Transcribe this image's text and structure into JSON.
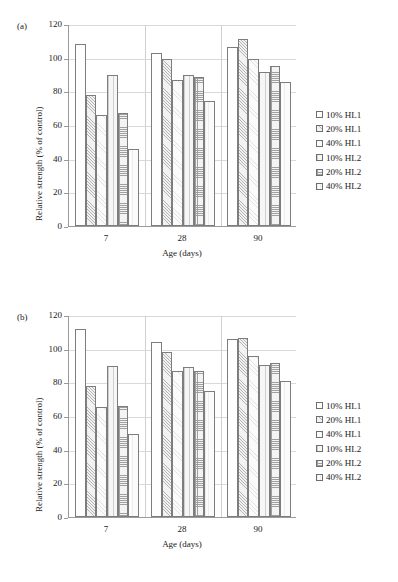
{
  "figure": {
    "panels": [
      {
        "label": "(a)"
      },
      {
        "label": "(b)"
      }
    ],
    "axis": {
      "xlabel": "Age (days)",
      "ylabel": "Relative strength (% of control)",
      "yticks": [
        "0",
        "20",
        "40",
        "60",
        "80",
        "100",
        "120"
      ],
      "xticks": [
        "7",
        "28",
        "90"
      ]
    },
    "legend": {
      "items": [
        {
          "label": "10% HL1",
          "pattern": "p-empty"
        },
        {
          "label": "20% HL1",
          "pattern": "p-diag"
        },
        {
          "label": "40% HL1",
          "pattern": "p-light"
        },
        {
          "label": "10% HL2",
          "pattern": "p-dot"
        },
        {
          "label": "20% HL2",
          "pattern": "p-grid"
        },
        {
          "label": "40% HL2",
          "pattern": "p-plain"
        }
      ]
    }
  },
  "chart_data": [
    {
      "type": "bar",
      "title": "(a)",
      "xlabel": "Age (days)",
      "ylabel": "Relative strength (% of control)",
      "categories": [
        "7",
        "28",
        "90"
      ],
      "ylim": [
        0,
        120
      ],
      "yticks": [
        0,
        20,
        40,
        60,
        80,
        100,
        120
      ],
      "grid": true,
      "legend_position": "right",
      "series": [
        {
          "name": "10% HL1",
          "values": [
            108,
            103,
            106.5
          ]
        },
        {
          "name": "20% HL1",
          "values": [
            78,
            99.5,
            111
          ]
        },
        {
          "name": "40% HL1",
          "values": [
            66,
            86.5,
            99.5
          ]
        },
        {
          "name": "10% HL2",
          "values": [
            90,
            90,
            91.5
          ]
        },
        {
          "name": "20% HL2",
          "values": [
            67,
            88.5,
            95
          ]
        },
        {
          "name": "40% HL2",
          "values": [
            46,
            74,
            85.5
          ]
        }
      ]
    },
    {
      "type": "bar",
      "title": "(b)",
      "xlabel": "Age (days)",
      "ylabel": "Relative strength (% of control)",
      "categories": [
        "7",
        "28",
        "90"
      ],
      "ylim": [
        0,
        120
      ],
      "yticks": [
        0,
        20,
        40,
        60,
        80,
        100,
        120
      ],
      "grid": true,
      "legend_position": "right",
      "series": [
        {
          "name": "10% HL1",
          "values": [
            111.5,
            104,
            105.5
          ]
        },
        {
          "name": "20% HL1",
          "values": [
            78,
            98,
            106.5
          ]
        },
        {
          "name": "40% HL1",
          "values": [
            65.5,
            87,
            95.5
          ]
        },
        {
          "name": "10% HL2",
          "values": [
            89.5,
            89,
            90.5
          ]
        },
        {
          "name": "20% HL2",
          "values": [
            66,
            86.5,
            91.5
          ]
        },
        {
          "name": "40% HL2",
          "values": [
            49.5,
            75,
            81
          ]
        }
      ]
    }
  ]
}
